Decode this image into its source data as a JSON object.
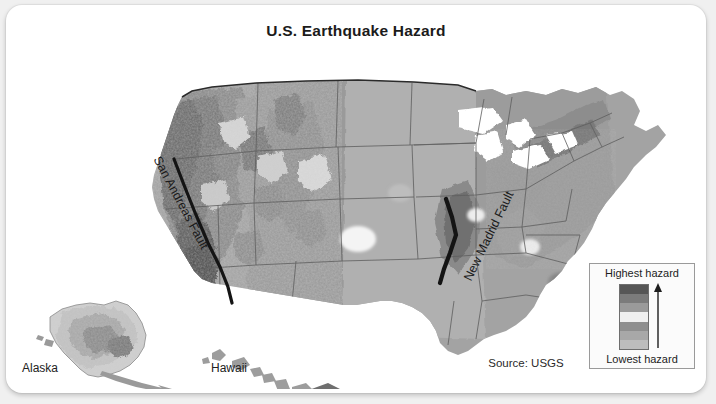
{
  "card": {
    "title": "U.S. Earthquake Hazard",
    "background_color": "#ffffff",
    "page_background_color": "#f0f0f0"
  },
  "map": {
    "type": "choropleth-hazard-map",
    "region": "United States",
    "credit": "Source: USGS",
    "insets": [
      {
        "name": "alaska-inset",
        "label": "Alaska"
      },
      {
        "name": "hawaii-inset",
        "label": "Hawaii"
      }
    ],
    "annotations": [
      {
        "name": "san-andreas-fault-label",
        "label": "San Andreas Fault",
        "rotation_deg": 62
      },
      {
        "name": "new-madrid-fault-label",
        "label": "New Madrid Fault",
        "rotation_deg": -64
      }
    ]
  },
  "legend": {
    "title_top": "Highest hazard",
    "title_bottom": "Lowest hazard",
    "direction": "up",
    "bands_top_to_bottom": [
      "#565656",
      "#7b7b7b",
      "#9a9a9a",
      "#efefef",
      "#8e8e8e",
      "#a8a8a8",
      "#bdbdbd"
    ]
  },
  "palette": {
    "highest": "#4f4f4f",
    "high": "#727272",
    "mid_high": "#8c8c8c",
    "mid": "#a3a3a3",
    "mid_low": "#b6b6b6",
    "low": "#cccccc",
    "lowest": "#efefef",
    "water": "#ffffff",
    "border": "#5a5a5a",
    "fault": "#141414"
  }
}
